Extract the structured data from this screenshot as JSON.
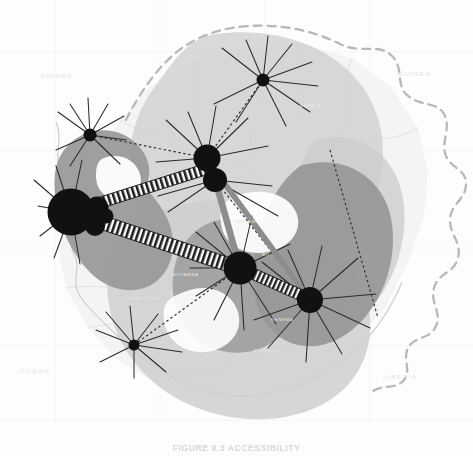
{
  "figure": {
    "caption": "FIGURE 9.3  ACCESSIBILITY",
    "caption_secondary": "",
    "alt_description": "Shaded accessibility surfaces and transport network over Sierra Leone",
    "background_color": "#fdfdfd",
    "ink_color": "#1a1a1a"
  },
  "map": {
    "projection_note": "",
    "basemap_tone": "#f1f1f1",
    "border": {
      "name": "international-boundary",
      "style": "dashed",
      "color": "#b9b9b9",
      "dash": "7 6",
      "width": 2.2
    },
    "coastline": {
      "name": "coastline",
      "color": "#c9c9c9",
      "width": 1.1
    },
    "graticule_color": "#ededed",
    "river_color": "#d6d6d6"
  },
  "labels": [
    {
      "id": "guinea-north",
      "text": "GUINEA",
      "x": 40,
      "y": 78,
      "size": 6.2,
      "color": "#e2e2e2",
      "spacing": 1.6
    },
    {
      "id": "guinea-east",
      "text": "GUINEA",
      "x": 398,
      "y": 76,
      "size": 6.2,
      "color": "#e2e2e2",
      "spacing": 1.6
    },
    {
      "id": "liberia-southeast",
      "text": "LIBERIA",
      "x": 383,
      "y": 379,
      "size": 6.2,
      "color": "#e2e2e2",
      "spacing": 1.6
    },
    {
      "id": "atlantic-ocean",
      "text": "OCEAN",
      "x": 20,
      "y": 373,
      "size": 6.2,
      "color": "#e4e4e4",
      "spacing": 1.6
    },
    {
      "id": "interior-place-1",
      "text": "MAKENI",
      "x": 236,
      "y": 223,
      "size": 4.4,
      "color": "#e6e6e6",
      "spacing": 0.8
    },
    {
      "id": "interior-place-2",
      "text": "BO",
      "x": 262,
      "y": 256,
      "size": 4.2,
      "color": "#e6e6e6",
      "spacing": 0.8
    },
    {
      "id": "interior-place-3",
      "text": "KENEMA",
      "x": 271,
      "y": 321,
      "size": 4.2,
      "color": "#e8e8e8",
      "spacing": 0.8
    },
    {
      "id": "interior-place-4",
      "text": "PUJEHUN",
      "x": 254,
      "y": 352,
      "size": 4.2,
      "color": "#e8e8e8",
      "spacing": 0.8
    },
    {
      "id": "interior-place-5",
      "text": "KABALA",
      "x": 300,
      "y": 107,
      "size": 4.2,
      "color": "#e9e9e9",
      "spacing": 0.8
    },
    {
      "id": "interior-place-6",
      "text": "PORT LOKO",
      "x": 128,
      "y": 300,
      "size": 4.2,
      "color": "#e9e9e9",
      "spacing": 0.8
    },
    {
      "id": "interior-place-7",
      "text": "MOYAMBA",
      "x": 172,
      "y": 276,
      "size": 4.2,
      "color": "#eaeaea",
      "spacing": 0.8
    }
  ],
  "surfaces": [
    {
      "id": "surface-outer-north",
      "tone": "#d0d0d0",
      "opacity": 0.85
    },
    {
      "id": "surface-outer-south",
      "tone": "#cfcfcf",
      "opacity": 0.85
    },
    {
      "id": "surface-core-west",
      "tone": "#9b9b9b",
      "opacity": 0.92
    },
    {
      "id": "surface-core-east",
      "tone": "#9a9a9a",
      "opacity": 0.92
    },
    {
      "id": "surface-core-central",
      "tone": "#a2a2a2",
      "opacity": 0.9
    }
  ],
  "nodes": [
    {
      "id": "node-freetown",
      "label": "Freetown",
      "x": 71,
      "y": 212,
      "r": 23.5,
      "rank": 1,
      "spokes": 11
    },
    {
      "id": "node-waterloo",
      "label": "Waterloo",
      "x": 97,
      "y": 208,
      "r": 11.5,
      "rank": 3,
      "spokes": 0
    },
    {
      "id": "node-lunsar",
      "label": "Lunsar",
      "x": 95,
      "y": 226,
      "r": 10.0,
      "rank": 3,
      "spokes": 0
    },
    {
      "id": "node-hastings",
      "label": "Hastings",
      "x": 106,
      "y": 216,
      "r": 7.5,
      "rank": 4,
      "spokes": 0
    },
    {
      "id": "node-portloko",
      "label": "Port Loko",
      "x": 90,
      "y": 135,
      "r": 6.5,
      "rank": 4,
      "spokes": 9
    },
    {
      "id": "node-makeni",
      "label": "Makeni",
      "x": 207,
      "y": 158,
      "r": 13.5,
      "rank": 2,
      "spokes": 9
    },
    {
      "id": "node-magburaka",
      "label": "Magburaka",
      "x": 215,
      "y": 180,
      "r": 12.0,
      "rank": 2,
      "spokes": 0
    },
    {
      "id": "node-kabala",
      "label": "Kabala",
      "x": 263,
      "y": 80,
      "r": 6.5,
      "rank": 4,
      "spokes": 10
    },
    {
      "id": "node-bo",
      "label": "Bo",
      "x": 240,
      "y": 268,
      "r": 16.5,
      "rank": 1,
      "spokes": 10
    },
    {
      "id": "node-kenema",
      "label": "Kenema",
      "x": 310,
      "y": 300,
      "r": 13.0,
      "rank": 2,
      "spokes": 10
    },
    {
      "id": "node-moyamba",
      "label": "Moyamba",
      "x": 134,
      "y": 345,
      "r": 5.5,
      "rank": 4,
      "spokes": 9
    }
  ],
  "corridors": [
    {
      "id": "corridor-freetown-makeni",
      "from": "node-freetown",
      "to": "node-makeni",
      "width": 9,
      "style": "ladder"
    },
    {
      "id": "corridor-freetown-bo",
      "from": "node-freetown",
      "to": "node-bo",
      "width": 11,
      "style": "ladder"
    },
    {
      "id": "corridor-bo-kenema",
      "from": "node-bo",
      "to": "node-kenema",
      "width": 8,
      "style": "ladder"
    },
    {
      "id": "corridor-makeni-bo",
      "from": "node-makeni",
      "to": "node-bo",
      "width": 6,
      "style": "solid-grey"
    },
    {
      "id": "corridor-makeni-kenema",
      "from": "node-makeni",
      "to": "node-kenema",
      "width": 5,
      "style": "solid-grey"
    }
  ],
  "legend": {
    "scale_bar": {
      "name": "scale-bar",
      "visible": true,
      "tick_count": 8,
      "color": "#dcdcdc"
    }
  }
}
